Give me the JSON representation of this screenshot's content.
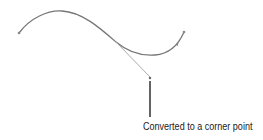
{
  "figure": {
    "caption": "Converted to a corner point",
    "colors": {
      "curve": "#7a7a7a",
      "handle": "#9a9a9a",
      "callout": "#222222",
      "text": "#1a1a1a"
    }
  }
}
